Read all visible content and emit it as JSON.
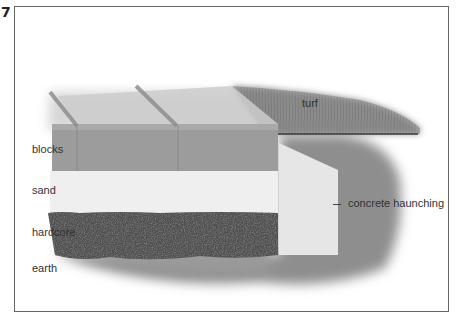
{
  "figure": {
    "number": "7"
  },
  "labels": {
    "blocks": "blocks",
    "sand": "sand",
    "hardcore": "hardcore",
    "earth": "earth",
    "turf": "turf",
    "concrete_haunching": "concrete haunching"
  },
  "colors": {
    "frame": "#666666",
    "blocks_front": "#9a9a9a",
    "blocks_top": "#c8c8c8",
    "sand": "#ededed",
    "hardcore": "#4a4a4a",
    "earth": "#8c8c8c",
    "turf": "#7e7e7e",
    "concrete": "#e4e4e4"
  }
}
